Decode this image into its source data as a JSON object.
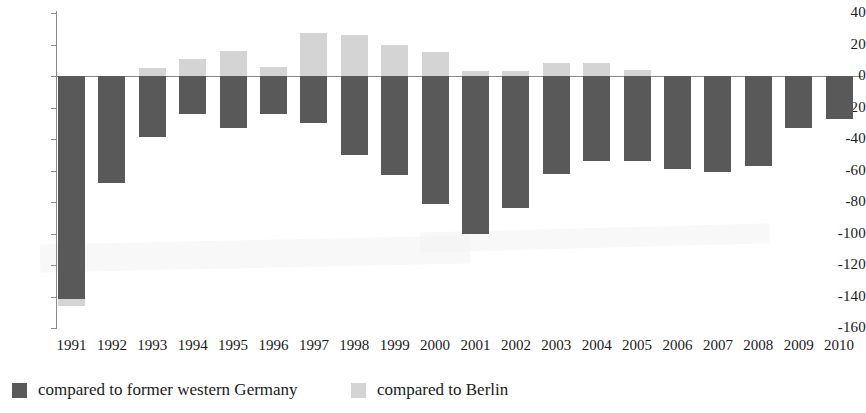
{
  "chart_data": {
    "type": "bar",
    "title": "",
    "subtitle": "",
    "xlabel": "",
    "ylabel": "",
    "stacked": false,
    "grid": false,
    "legend_position": "bottom-left",
    "ylim": [
      -160,
      40
    ],
    "yticks": [
      40,
      20,
      0,
      -20,
      -40,
      -60,
      -80,
      -100,
      -120,
      -140,
      -160
    ],
    "ytick_labels": [
      "40",
      "20",
      "0",
      "-20",
      "-40",
      "-60",
      "-80",
      "-100",
      "-120",
      "-140",
      "-160"
    ],
    "categories": [
      "1991",
      "1992",
      "1993",
      "1994",
      "1995",
      "1996",
      "1997",
      "1998",
      "1999",
      "2000",
      "2001",
      "2002",
      "2003",
      "2004",
      "2005",
      "2006",
      "2007",
      "2008",
      "2009",
      "2010"
    ],
    "series": [
      {
        "name": "compared to former western Germany",
        "color": "#595959",
        "values": [
          -146,
          -68,
          -39,
          -24,
          -33,
          -24,
          -30,
          -50,
          -63,
          -81,
          -100,
          -84,
          -62,
          -54,
          -54,
          -59,
          -61,
          -57,
          -33,
          -27
        ]
      },
      {
        "name": "compared to Berlin",
        "color": "#d4d4d4",
        "values": [
          0,
          0,
          5,
          11,
          16,
          6,
          27,
          26,
          20,
          15,
          3,
          3,
          8,
          8,
          4,
          0,
          0,
          0,
          0,
          0
        ]
      }
    ]
  },
  "legend": {
    "items": [
      {
        "label": "compared to former western Germany",
        "color": "#595959",
        "swatch": "dark-gray-swatch"
      },
      {
        "label": "compared to Berlin",
        "color": "#d4d4d4",
        "swatch": "light-gray-swatch"
      }
    ]
  },
  "axes": {
    "y_tick_labels": [
      "40",
      "20",
      "0",
      "-20",
      "-40",
      "-60",
      "-80",
      "-100",
      "-120",
      "-140",
      "-160"
    ],
    "x_tick_labels": [
      "1991",
      "1992",
      "1993",
      "1994",
      "1995",
      "1996",
      "1997",
      "1998",
      "1999",
      "2000",
      "2001",
      "2002",
      "2003",
      "2004",
      "2005",
      "2006",
      "2007",
      "2008",
      "2009",
      "2010"
    ]
  }
}
